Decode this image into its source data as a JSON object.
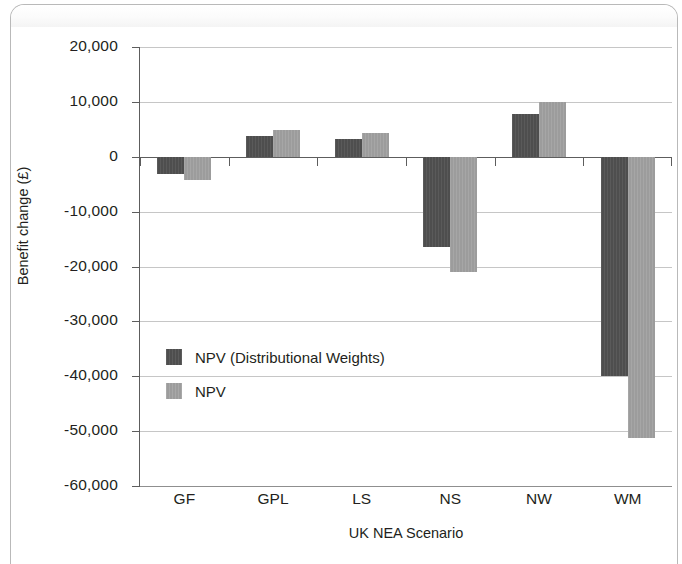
{
  "chart_data": {
    "type": "bar",
    "title": "",
    "xlabel": "UK NEA Scenario",
    "ylabel": "Benefit change (£)",
    "categories": [
      "GF",
      "GPL",
      "LS",
      "NS",
      "NW",
      "WM"
    ],
    "series": [
      {
        "name": "NPV (Distributional Weights)",
        "color": "#4e4e4e",
        "values": [
          -3100,
          3700,
          3300,
          -16500,
          7700,
          -40000
        ]
      },
      {
        "name": "NPV",
        "color": "#9c9c9c",
        "values": [
          -4200,
          4800,
          4400,
          -21000,
          10000,
          -51200
        ]
      }
    ],
    "ylim": [
      -60000,
      20000
    ],
    "ytick_values": [
      20000,
      10000,
      0,
      -10000,
      -20000,
      -30000,
      -40000,
      -50000,
      -60000
    ],
    "ytick_labels": [
      "20,000",
      "10,000",
      "0",
      "-10,000",
      "-20,000",
      "-30,000",
      "-40,000",
      "-50,000",
      "-60,000"
    ],
    "grid": true,
    "legend_position": "inside-lower-left",
    "orientation": "vertical"
  },
  "legend": {
    "entries": [
      {
        "label": "NPV (Distributional Weights)",
        "swatch": "dark"
      },
      {
        "label": "NPV",
        "swatch": "light"
      }
    ]
  }
}
